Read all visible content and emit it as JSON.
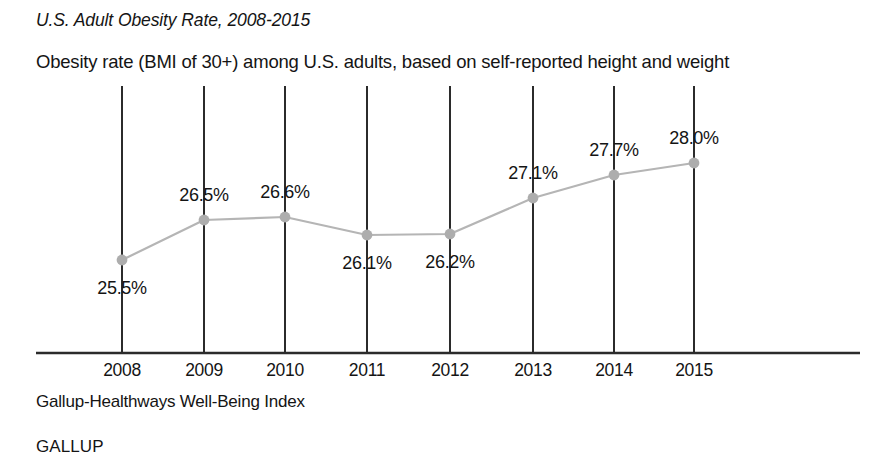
{
  "chart_data": {
    "type": "line",
    "title": "U.S. Adult Obesity Rate, 2008-2015",
    "subtitle": "Obesity rate (BMI of 30+) among U.S. adults, based on self-reported height and weight",
    "xlabel": "",
    "ylabel": "",
    "categories": [
      "2008",
      "2009",
      "2010",
      "2011",
      "2012",
      "2013",
      "2014",
      "2015"
    ],
    "values": [
      25.5,
      26.5,
      26.6,
      26.1,
      26.2,
      27.1,
      27.7,
      28.0
    ],
    "point_labels": [
      "25.5%",
      "26.5%",
      "26.6%",
      "26.1%",
      "26.2%",
      "27.1%",
      "27.7%",
      "28.0%"
    ],
    "label_positions": [
      "below",
      "above",
      "above",
      "below",
      "below",
      "above",
      "above",
      "above"
    ],
    "ylim": [
      25.0,
      28.6
    ],
    "grid": "vertical",
    "legend": "none",
    "series": [
      {
        "name": "U.S. adult obesity rate",
        "values": [
          25.5,
          26.5,
          26.6,
          26.1,
          26.2,
          27.1,
          27.7,
          28.0
        ]
      }
    ]
  },
  "source": {
    "index_name": "Gallup-Healthways Well-Being Index",
    "brand": "GALLUP"
  },
  "colors": {
    "marker": "#adadad",
    "line": "#b5b5b5",
    "gridline": "#2b2b2b",
    "axis": "#2b2b2b",
    "text": "#141414",
    "background": "#ffffff"
  },
  "geometry": {
    "x_positions": [
      122,
      204,
      285,
      367,
      450,
      533,
      614,
      694
    ],
    "y_positions": [
      260,
      220,
      217,
      235,
      234,
      198,
      175,
      163
    ],
    "grid_top": 86,
    "axis_y": 353,
    "axis_x_start": 36,
    "axis_x_end": 860
  }
}
